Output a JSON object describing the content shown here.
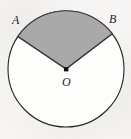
{
  "figure": {
    "kind": "geometry-diagram",
    "background_color": "#f6f5f3",
    "circle": {
      "center_x": 66,
      "center_y": 69,
      "radius": 58,
      "stroke_color": "#262626",
      "stroke_width": 1,
      "fill_color": "#fdfdfc"
    },
    "sector": {
      "name": "sector-AOB",
      "fill_color": "#a9a9a9",
      "stroke_color": "#3a3a3a",
      "stroke_width": 1,
      "start_angle_deg": 37,
      "end_angle_deg": 146,
      "central_angle_deg": 109,
      "point_a_x": 18,
      "point_a_y": 36,
      "point_b_x": 112,
      "point_b_y": 34
    },
    "center_marker": {
      "name": "center-point-O",
      "x": 66,
      "y": 69,
      "size": 4,
      "color": "#111111"
    },
    "labels": {
      "a": "A",
      "b": "B",
      "o": "O"
    }
  }
}
